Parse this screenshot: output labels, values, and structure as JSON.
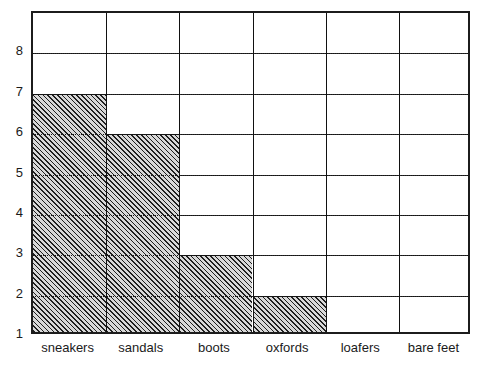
{
  "chart_data": {
    "type": "bar",
    "title": "",
    "subtitle": "",
    "xlabel": "",
    "ylabel": "",
    "categories": [
      "sneakers",
      "sandals",
      "boots",
      "oxfords",
      "loafers",
      "bare feet"
    ],
    "values": [
      7,
      6,
      3,
      2,
      1,
      1
    ],
    "ytick_labels": [
      "1",
      "2",
      "3",
      "4",
      "5",
      "6",
      "7",
      "8"
    ],
    "ytick_values": [
      1,
      2,
      3,
      4,
      5,
      6,
      7,
      8
    ],
    "ylim": [
      1,
      9
    ],
    "xlim": [
      0,
      6
    ],
    "grid": true,
    "grid_orientation": "both",
    "legend": null,
    "legend_position": "none",
    "annotations": [],
    "bar_fill": "diagonal-hatch",
    "bar_fill_color": "#d8d8d8",
    "bar_hatch_color": "#1f1f1f",
    "axis_color": "#1c1c1c",
    "grid_color": "#2a2a2a",
    "background": "#ffffff",
    "bar_width_fraction": 1.0,
    "note": "Each cell of the grid represents one unit; shaded columns count from the baseline row labelled 1."
  },
  "axes": {
    "y_axis_name": "count-axis",
    "x_axis_name": "footwear-category-axis"
  }
}
